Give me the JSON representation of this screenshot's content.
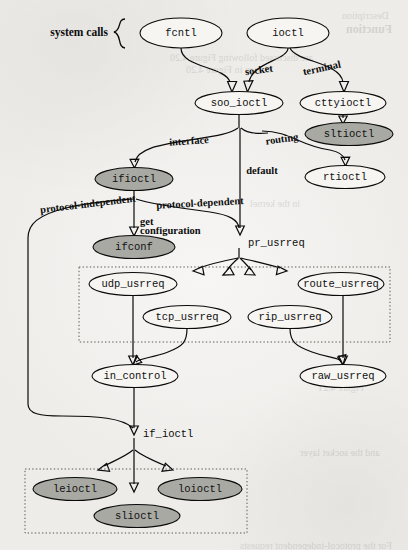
{
  "figure": {
    "colors": {
      "page_background": "#f2f1ee",
      "node_fill_plain": "#f6f5f2",
      "node_fill_shaded": "#a9a9a4",
      "stroke": "#0a0a0a",
      "dotted_box_stroke": "#5a5a55"
    }
  },
  "group_labels": [
    {
      "id": "system-calls",
      "text": "system calls",
      "x": 108,
      "y": 33
    }
  ],
  "nodes": [
    {
      "id": "fcntl",
      "label": "fcntl",
      "cx": 181,
      "cy": 33,
      "rx": 41,
      "ry": 15,
      "shaded": false
    },
    {
      "id": "ioctl",
      "label": "ioctl",
      "cx": 288,
      "cy": 33,
      "rx": 41,
      "ry": 15,
      "shaded": false
    },
    {
      "id": "soo_ioctl",
      "label": "soo_ioctl",
      "cx": 239,
      "cy": 103,
      "rx": 44,
      "ry": 11.5,
      "shaded": false
    },
    {
      "id": "cttyioctl",
      "label": "cttyioctl",
      "cx": 343,
      "cy": 103,
      "rx": 43,
      "ry": 11.5,
      "shaded": false
    },
    {
      "id": "sltioctl",
      "label": "sltioctl",
      "cx": 349,
      "cy": 134,
      "rx": 44,
      "ry": 11.5,
      "shaded": true
    },
    {
      "id": "rtioctl",
      "label": "rtioctl",
      "cx": 345,
      "cy": 177,
      "rx": 40,
      "ry": 11.5,
      "shaded": false
    },
    {
      "id": "ifioctl",
      "label": "ifioctl",
      "cx": 134,
      "cy": 179,
      "rx": 39,
      "ry": 11.5,
      "shaded": true
    },
    {
      "id": "ifconf",
      "label": "ifconf",
      "cx": 134,
      "cy": 247,
      "rx": 41,
      "ry": 11.5,
      "shaded": true
    },
    {
      "id": "udp_usrreq",
      "label": "udp_usrreq",
      "cx": 133,
      "cy": 284,
      "rx": 44,
      "ry": 11.5,
      "shaded": false
    },
    {
      "id": "route_usrreq",
      "label": "route_usrreq",
      "cx": 341,
      "cy": 284,
      "rx": 43,
      "ry": 11.5,
      "shaded": false
    },
    {
      "id": "tcp_usrreq",
      "label": "tcp_usrreq",
      "cx": 187,
      "cy": 317,
      "rx": 44,
      "ry": 11.5,
      "shaded": false
    },
    {
      "id": "rip_usrreq",
      "label": "rip_usrreq",
      "cx": 290,
      "cy": 317,
      "rx": 42,
      "ry": 11.5,
      "shaded": false
    },
    {
      "id": "in_control",
      "label": "in_control",
      "cx": 135,
      "cy": 376,
      "rx": 43,
      "ry": 11.5,
      "shaded": false
    },
    {
      "id": "raw_usrreq",
      "label": "raw_usrreq",
      "cx": 343,
      "cy": 376,
      "rx": 43,
      "ry": 11.5,
      "shaded": false
    },
    {
      "id": "leioctl",
      "label": "leioctl",
      "cx": 75,
      "cy": 489,
      "rx": 42,
      "ry": 11.5,
      "shaded": true
    },
    {
      "id": "loioctl",
      "label": "loioctl",
      "cx": 200,
      "cy": 489,
      "rx": 42,
      "ry": 11.5,
      "shaded": true
    },
    {
      "id": "slioctl",
      "label": "slioctl",
      "cx": 137,
      "cy": 516,
      "rx": 43,
      "ry": 11.5,
      "shaded": true
    }
  ],
  "edge_labels": [
    {
      "id": "socket",
      "text": "socket",
      "x": 259,
      "y": 71,
      "style": "serif-bold"
    },
    {
      "id": "terminal",
      "text": "terminal",
      "x": 320,
      "y": 69,
      "style": "serif-bold"
    },
    {
      "id": "interface",
      "text": "interface",
      "x": 189,
      "y": 142,
      "style": "serif-bold"
    },
    {
      "id": "routing",
      "text": "routing",
      "x": 280,
      "y": 140,
      "style": "serif-bold"
    },
    {
      "id": "default",
      "text": "default",
      "x": 262,
      "y": 172,
      "style": "serif-bold"
    },
    {
      "id": "protocol-independent",
      "text": "protocol-independent",
      "x": 88,
      "y": 205,
      "style": "serif-bold"
    },
    {
      "id": "protocol-dependent",
      "text": "protocol-dependent",
      "x": 200,
      "y": 204,
      "style": "serif-bold"
    },
    {
      "id": "get",
      "text": "get",
      "x": 160,
      "y": 222,
      "style": "serif-bold-left"
    },
    {
      "id": "configuration",
      "text": "configuration",
      "x": 159,
      "y": 231,
      "style": "serif-bold-left"
    },
    {
      "id": "pr_usrreq",
      "text": "pr_usrreq",
      "x": 245,
      "y": 243,
      "style": "mono-left"
    },
    {
      "id": "if_ioctl",
      "text": "if_ioctl",
      "x": 143,
      "y": 434,
      "style": "mono-left"
    }
  ],
  "dotted_boxes": [
    {
      "id": "protocol-usrreq-group",
      "x": 79,
      "y": 267,
      "width": 311,
      "height": 75
    },
    {
      "id": "device-ioctl-group",
      "x": 25,
      "y": 469,
      "width": 222,
      "height": 64
    }
  ],
  "background_ghost_text": [
    {
      "text": "Function",
      "x": 346,
      "y": 22,
      "big": true
    },
    {
      "text": "Description",
      "x": 342,
      "y": 10,
      "big": false
    },
    {
      "text": "are discussed following Figure 4.20",
      "x": 170,
      "y": 52,
      "big": false
    },
    {
      "text": "shown in Figure 4.20",
      "x": 186,
      "y": 64,
      "big": false
    },
    {
      "text": "in the kernel",
      "x": 250,
      "y": 198,
      "big": false
    },
    {
      "text": "Figure 4.21",
      "x": 318,
      "y": 382,
      "big": false
    },
    {
      "text": "and the socket layer",
      "x": 300,
      "y": 447,
      "big": false
    },
    {
      "text": "For the protocol-independent requests",
      "x": 240,
      "y": 540,
      "big": false
    }
  ]
}
